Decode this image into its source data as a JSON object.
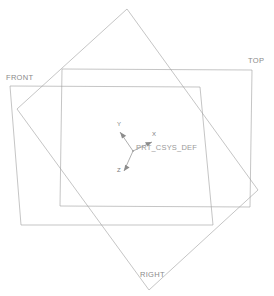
{
  "viewport": {
    "width": 274,
    "height": 296,
    "background": "#ffffff",
    "name": "3d-model-viewport"
  },
  "scene": {
    "kind": "cad-datum-display",
    "line_color": "#9b9b9b",
    "text_color": "#8a8a8a"
  },
  "datum_planes": [
    {
      "id": "top",
      "label": "TOP",
      "label_x": 248,
      "label_y": 62,
      "stroke": "#9e9e9e",
      "points": "62,69 252,70 250,207 60,206"
    },
    {
      "id": "front",
      "label": "FRONT",
      "label_x": 6,
      "label_y": 78,
      "stroke": "#9e9e9e",
      "points": "10,86 200,87 213,225 21,225"
    },
    {
      "id": "right",
      "label": "RIGHT",
      "label_x": 140,
      "label_y": 274,
      "stroke": "#9e9e9e",
      "points": "127,9 258,190 149,290 17,109"
    }
  ],
  "coordinate_system": {
    "name": "PRT_CSYS_DEF",
    "label_x": 136,
    "label_y": 146,
    "origin_x": 133,
    "origin_y": 151,
    "axes": [
      {
        "name": "X",
        "label": "X",
        "tip_x": 152,
        "tip_y": 142,
        "label_x": 152,
        "label_y": 134
      },
      {
        "name": "Y",
        "label": "Y",
        "tip_x": 120,
        "tip_y": 132,
        "label_x": 117,
        "label_y": 124
      },
      {
        "name": "Z",
        "label": "Z",
        "tip_x": 124,
        "tip_y": 171,
        "label_x": 119,
        "label_y": 171
      }
    ]
  }
}
